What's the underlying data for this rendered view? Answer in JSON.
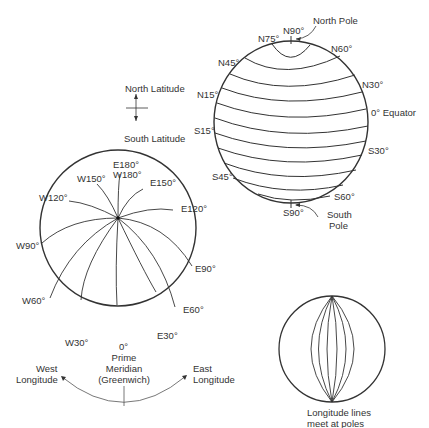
{
  "latitude_globe": {
    "north_pole_label": "North Pole",
    "south_pole_label": [
      "South",
      "Pole"
    ],
    "equator_label": "0°  Equator",
    "labels": {
      "N90": "N90°",
      "N75": "N75°",
      "N60": "N60°",
      "N45": "N45°",
      "N30": "N30°",
      "N15": "N15°",
      "S15": "S15°",
      "S30": "S30°",
      "S45": "S45°",
      "S60": "S60°",
      "S90": "S90°"
    }
  },
  "latitude_legend": {
    "north": "North Latitude",
    "south": "South Latitude"
  },
  "longitude_globe": {
    "labels": {
      "E180": "E180°",
      "W180": "W180°",
      "W150": "W150°",
      "E150": "E150°",
      "W120": "W120°",
      "E120": "E120°",
      "W90": "W90°",
      "E90": "E90°",
      "W60": "W60°",
      "E60": "E60°",
      "W30": "W30°",
      "E30": "E30°",
      "zero": "0°"
    },
    "prime_meridian": [
      "Prime",
      "Meridian",
      "(Greenwich)"
    ],
    "west": [
      "West",
      "Longitude"
    ],
    "east": [
      "East",
      "Longitude"
    ]
  },
  "small_globe": {
    "caption": [
      "Longitude lines",
      "meet at poles"
    ]
  },
  "colors": {
    "line": "#333333",
    "thin": "#555555",
    "background": "#ffffff"
  }
}
